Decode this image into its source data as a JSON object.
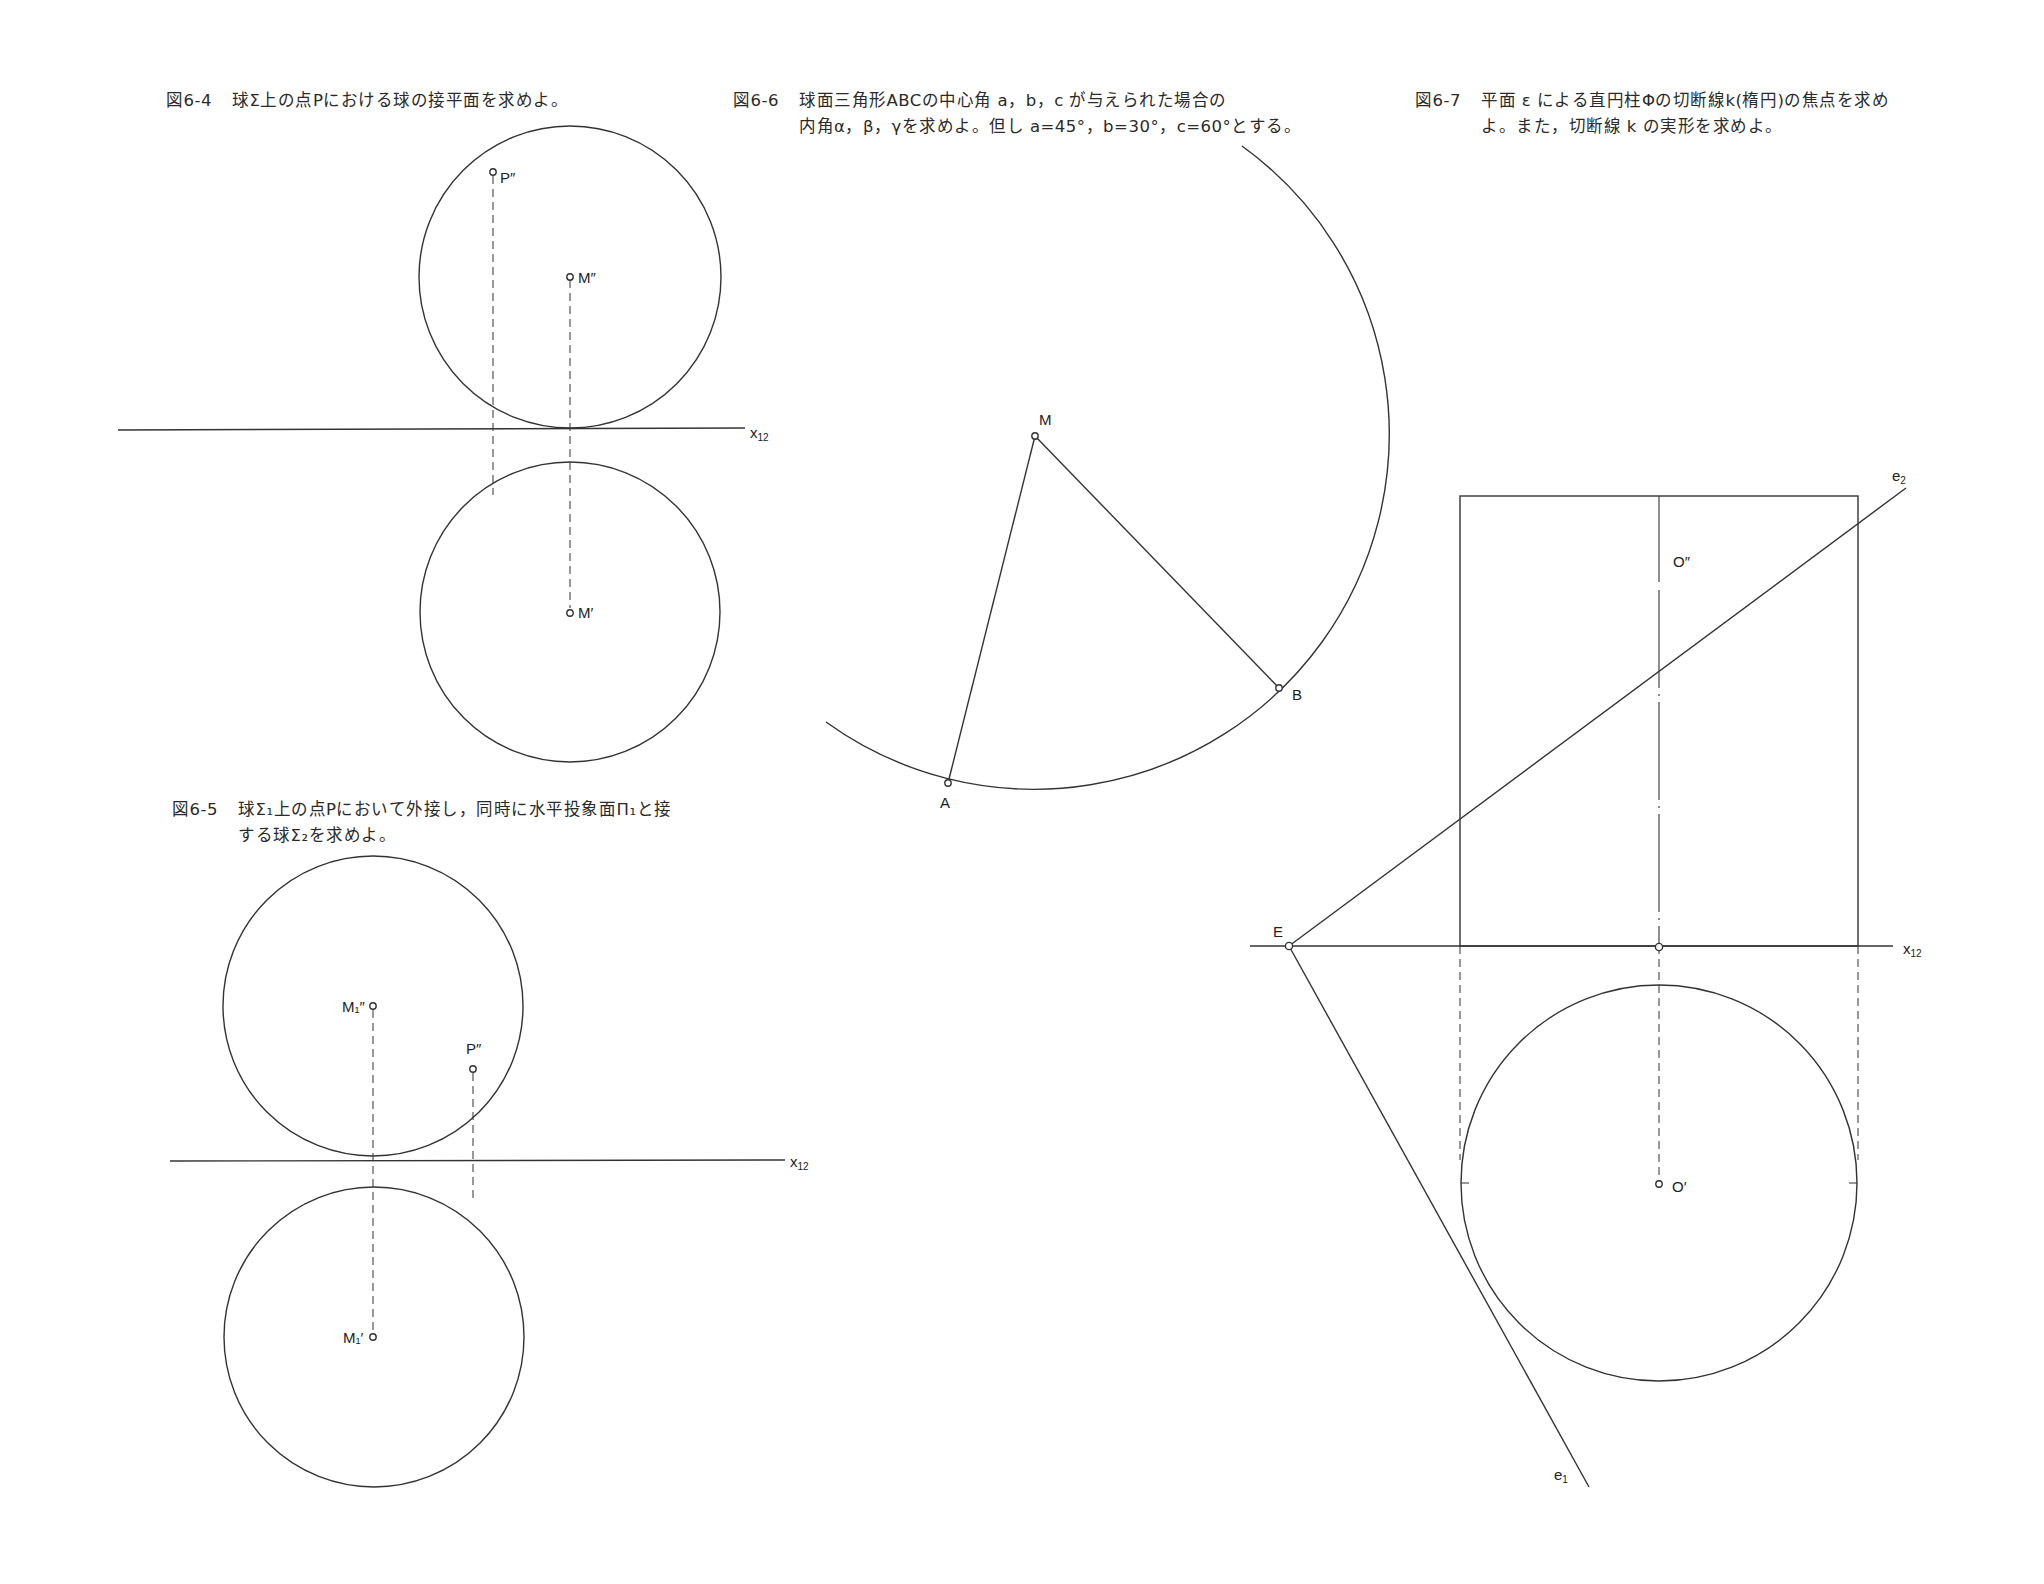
{
  "figures": {
    "fig_6_4": {
      "number": "図6-4",
      "lines": [
        "球Σ上の点Pにおける球の接平面を求めよ。"
      ],
      "labels": {
        "p2": "P″",
        "m2": "M″",
        "m1": "M′",
        "axis": "x",
        "axis_sub": "12"
      }
    },
    "fig_6_5": {
      "number": "図6-5",
      "lines": [
        "球Σ₁上の点Pにおいて外接し，同時に水平投象面Π₁と接",
        "する球Σ₂を求めよ。"
      ],
      "labels": {
        "m12": "M₁″",
        "p2": "P″",
        "m11": "M₁′",
        "axis": "x",
        "axis_sub": "12"
      }
    },
    "fig_6_6": {
      "number": "図6-6",
      "lines": [
        "球面三角形ABCの中心角 a，b，c が与えられた場合の",
        "内角α，β，γを求めよ。但し a=45°，b=30°，c=60°とする。"
      ],
      "labels": {
        "m": "M",
        "a": "A",
        "b": "B"
      }
    },
    "fig_6_7": {
      "number": "図6-7",
      "lines": [
        "平面 ε による直円柱Φの切断線k(楕円)の焦点を求め",
        "よ。また，切断線 k の実形を求めよ。"
      ],
      "labels": {
        "o2": "O″",
        "o1": "O′",
        "e": "E",
        "e1": "e",
        "e1_sub": "1",
        "e2": "e",
        "e2_sub": "2",
        "axis": "x",
        "axis_sub": "12"
      }
    }
  }
}
